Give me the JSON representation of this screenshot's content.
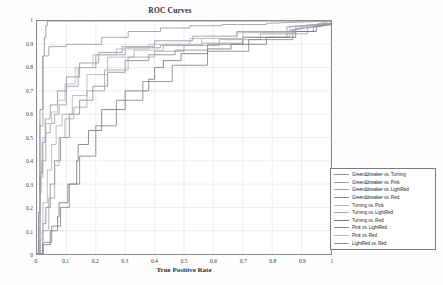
{
  "chart_data": {
    "type": "line",
    "title": "ROC Curves",
    "xlabel": "True Positive Rate",
    "ylabel": "False Positive Rate",
    "xlim": [
      0,
      1
    ],
    "ylim": [
      0,
      1
    ],
    "grid": true,
    "legend_position": "lower right",
    "xticks": [
      "0",
      "0.1",
      "0.2",
      "0.3",
      "0.4",
      "0.5",
      "0.6",
      "0.7",
      "0.8",
      "0.9",
      "1"
    ],
    "yticks": [
      "0",
      "0.1",
      "0.2",
      "0.3",
      "0.4",
      "0.5",
      "0.6",
      "0.7",
      "0.8",
      "0.9",
      "1"
    ],
    "xtick_values": [
      0,
      0.1,
      0.2,
      0.3,
      0.4,
      0.5,
      0.6,
      0.7,
      0.8,
      0.9,
      1
    ],
    "ytick_values": [
      0,
      0.1,
      0.2,
      0.3,
      0.4,
      0.5,
      0.6,
      0.7,
      0.8,
      0.9,
      1
    ],
    "series": [
      {
        "name": "Green&breaker vs. Turning",
        "color": "#8f8f93",
        "x": [
          0,
          0.01,
          0.01,
          0.02,
          0.02,
          0.025,
          0.025,
          0.03,
          0.03,
          0.035,
          0.035,
          0.42,
          0.42,
          1.0
        ],
        "y": [
          0,
          0,
          0.62,
          0.62,
          0.85,
          0.85,
          0.93,
          0.93,
          0.98,
          0.98,
          1.0,
          1.0,
          1.0,
          1.0
        ]
      },
      {
        "name": "Green&breaker vs. Pink",
        "color": "#9a9a9e",
        "x": [
          0,
          0.01,
          0.01,
          0.02,
          0.02,
          0.04,
          0.04,
          0.1,
          0.1,
          0.22,
          0.22,
          0.31,
          0.31,
          0.42,
          0.42,
          0.52,
          0.52,
          0.63,
          0.63,
          0.78,
          0.78,
          1.0
        ],
        "y": [
          0,
          0,
          0.55,
          0.55,
          0.85,
          0.85,
          0.89,
          0.89,
          0.9,
          0.9,
          0.93,
          0.93,
          0.955,
          0.955,
          0.97,
          0.97,
          0.98,
          0.98,
          0.985,
          0.985,
          0.99,
          1.0
        ]
      },
      {
        "name": "Green&breaker vs. LightRed",
        "color": "#9d9da1",
        "x": [
          0,
          0.005,
          0.005,
          0.01,
          0.01,
          0.02,
          0.02,
          0.03,
          0.03,
          0.045,
          0.045,
          0.06,
          0.06,
          0.075,
          0.075,
          0.1,
          0.1,
          0.14,
          0.14,
          0.2,
          0.2,
          0.3,
          0.3,
          0.42,
          0.42,
          0.56,
          0.56,
          0.7,
          0.7,
          0.86,
          0.86,
          1.0
        ],
        "y": [
          0,
          0,
          0.15,
          0.15,
          0.33,
          0.33,
          0.4,
          0.4,
          0.52,
          0.52,
          0.56,
          0.56,
          0.6,
          0.6,
          0.64,
          0.64,
          0.72,
          0.72,
          0.8,
          0.8,
          0.855,
          0.855,
          0.885,
          0.885,
          0.895,
          0.895,
          0.905,
          0.905,
          0.93,
          0.93,
          0.96,
          1.0
        ]
      },
      {
        "name": "Green&breaker vs. Red",
        "color": "#8a8a8e",
        "x": [
          0,
          0.01,
          0.01,
          0.02,
          0.02,
          0.03,
          0.03,
          0.045,
          0.045,
          0.06,
          0.06,
          0.08,
          0.08,
          0.11,
          0.11,
          0.145,
          0.145,
          0.19,
          0.19,
          0.24,
          0.24,
          0.3,
          0.3,
          0.38,
          0.38,
          0.47,
          0.47,
          0.58,
          0.58,
          0.7,
          0.7,
          0.85,
          0.85,
          0.94,
          0.94,
          1.0
        ],
        "y": [
          0,
          0,
          0.06,
          0.06,
          0.13,
          0.13,
          0.2,
          0.2,
          0.3,
          0.3,
          0.4,
          0.4,
          0.5,
          0.5,
          0.6,
          0.6,
          0.66,
          0.66,
          0.72,
          0.72,
          0.78,
          0.78,
          0.83,
          0.83,
          0.855,
          0.855,
          0.875,
          0.875,
          0.9,
          0.9,
          0.93,
          0.93,
          0.955,
          0.955,
          0.975,
          0.99
        ]
      },
      {
        "name": "Turning vs. Pink",
        "color": "#b3b3b7",
        "x": [
          0,
          0.01,
          0.01,
          0.02,
          0.02,
          0.035,
          0.035,
          0.05,
          0.05,
          0.065,
          0.065,
          0.085,
          0.085,
          0.12,
          0.12,
          0.17,
          0.17,
          0.24,
          0.24,
          0.33,
          0.33,
          0.43,
          0.43,
          0.56,
          0.56,
          0.7,
          0.7,
          0.88,
          0.88,
          1.0
        ],
        "y": [
          0,
          0,
          0.09,
          0.09,
          0.22,
          0.22,
          0.36,
          0.36,
          0.47,
          0.47,
          0.55,
          0.55,
          0.6,
          0.6,
          0.68,
          0.68,
          0.77,
          0.77,
          0.845,
          0.845,
          0.875,
          0.875,
          0.9,
          0.9,
          0.925,
          0.925,
          0.95,
          0.95,
          0.975,
          0.99
        ]
      },
      {
        "name": "Turning vs. LightRed",
        "color": "#a6a6aa",
        "x": [
          0,
          0.02,
          0.02,
          0.04,
          0.04,
          0.06,
          0.06,
          0.075,
          0.075,
          0.095,
          0.095,
          0.125,
          0.125,
          0.17,
          0.17,
          0.23,
          0.23,
          0.31,
          0.31,
          0.4,
          0.4,
          0.5,
          0.5,
          0.62,
          0.62,
          0.76,
          0.76,
          0.92,
          0.92,
          1.0
        ],
        "y": [
          0,
          0,
          0.1,
          0.1,
          0.24,
          0.24,
          0.38,
          0.38,
          0.5,
          0.5,
          0.58,
          0.58,
          0.63,
          0.63,
          0.7,
          0.7,
          0.79,
          0.79,
          0.845,
          0.845,
          0.87,
          0.87,
          0.895,
          0.895,
          0.92,
          0.92,
          0.945,
          0.945,
          0.97,
          0.985
        ]
      },
      {
        "name": "Turning vs. Red",
        "color": "#76767a",
        "x": [
          0,
          0.02,
          0.02,
          0.045,
          0.045,
          0.07,
          0.07,
          0.075,
          0.075,
          0.105,
          0.105,
          0.135,
          0.135,
          0.14,
          0.14,
          0.175,
          0.175,
          0.22,
          0.22,
          0.3,
          0.3,
          0.38,
          0.38,
          0.4,
          0.4,
          0.43,
          0.43,
          0.49,
          0.49,
          0.58,
          0.58,
          0.66,
          0.66,
          0.78,
          0.78,
          0.88,
          0.88,
          0.95,
          0.95,
          1.0
        ],
        "y": [
          0,
          0,
          0.04,
          0.04,
          0.1,
          0.1,
          0.16,
          0.16,
          0.22,
          0.22,
          0.3,
          0.3,
          0.4,
          0.4,
          0.47,
          0.47,
          0.53,
          0.53,
          0.62,
          0.62,
          0.7,
          0.7,
          0.75,
          0.75,
          0.8,
          0.8,
          0.83,
          0.83,
          0.86,
          0.86,
          0.88,
          0.88,
          0.9,
          0.9,
          0.93,
          0.93,
          0.955,
          0.955,
          0.975,
          0.985
        ]
      },
      {
        "name": "Pink vs. LightRed",
        "color": "#848488",
        "x": [
          0,
          0.02,
          0.02,
          0.05,
          0.05,
          0.08,
          0.08,
          0.11,
          0.11,
          0.145,
          0.145,
          0.2,
          0.2,
          0.27,
          0.27,
          0.36,
          0.36,
          0.46,
          0.46,
          0.58,
          0.58,
          0.72,
          0.72,
          0.87,
          0.87,
          1.0
        ],
        "y": [
          0,
          0,
          0.05,
          0.05,
          0.12,
          0.12,
          0.2,
          0.2,
          0.3,
          0.3,
          0.42,
          0.42,
          0.55,
          0.55,
          0.66,
          0.66,
          0.74,
          0.74,
          0.81,
          0.81,
          0.87,
          0.87,
          0.92,
          0.92,
          0.96,
          0.99
        ]
      },
      {
        "name": "Pink vs. Red",
        "color": "#bcbcc0",
        "x": [
          0,
          0.005,
          0.005,
          0.01,
          0.01,
          0.015,
          0.015,
          0.02,
          0.02,
          0.03,
          0.03,
          0.05,
          0.05,
          0.07,
          0.07,
          0.095,
          0.095,
          0.13,
          0.13,
          0.19,
          0.19,
          0.27,
          0.27,
          0.38,
          0.38,
          0.52,
          0.52,
          0.68,
          0.68,
          0.86,
          0.86,
          1.0
        ],
        "y": [
          0,
          0,
          0.12,
          0.12,
          0.26,
          0.26,
          0.4,
          0.4,
          0.5,
          0.5,
          0.56,
          0.56,
          0.61,
          0.61,
          0.66,
          0.66,
          0.73,
          0.73,
          0.8,
          0.8,
          0.855,
          0.855,
          0.88,
          0.88,
          0.9,
          0.9,
          0.925,
          0.925,
          0.95,
          0.95,
          0.975,
          0.99
        ]
      },
      {
        "name": "LightRed vs. Red",
        "color": "#9494a8",
        "x": [
          0,
          0.005,
          0.005,
          0.01,
          0.01,
          0.018,
          0.018,
          0.028,
          0.028,
          0.045,
          0.045,
          0.07,
          0.07,
          0.1,
          0.1,
          0.145,
          0.145,
          0.21,
          0.21,
          0.29,
          0.29,
          0.4,
          0.4,
          0.53,
          0.53,
          0.68,
          0.68,
          0.85,
          0.85,
          1.0
        ],
        "y": [
          0,
          0,
          0.18,
          0.18,
          0.35,
          0.35,
          0.48,
          0.48,
          0.58,
          0.58,
          0.64,
          0.64,
          0.7,
          0.7,
          0.76,
          0.76,
          0.82,
          0.82,
          0.865,
          0.865,
          0.89,
          0.89,
          0.915,
          0.915,
          0.935,
          0.935,
          0.955,
          0.955,
          0.975,
          0.99
        ]
      }
    ]
  },
  "legend": {
    "items": [
      "Green&breaker vs. Turning",
      "Green&breaker vs. Pink",
      "Green&breaker vs. LightRed",
      "Green&breaker vs. Red",
      "Turning vs. Pink",
      "Turning vs. LightRed",
      "Turning vs. Red",
      "Pink vs. LightRed",
      "Pink vs. Red",
      "LightRed vs. Red"
    ]
  }
}
